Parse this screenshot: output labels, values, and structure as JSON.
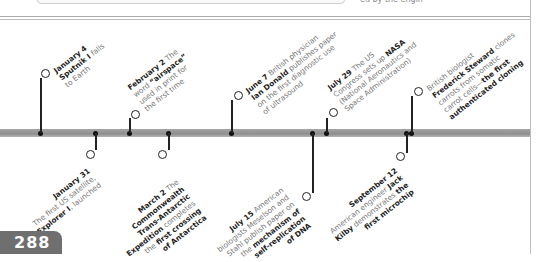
{
  "page": {
    "number": "288"
  },
  "header": {
    "fragment": "ed by the engin"
  },
  "timeline": {
    "above": [
      {
        "date": "January 4",
        "lines": [
          [
            "Sputnik I",
            " falls"
          ],
          [
            "to Earth"
          ]
        ]
      },
      {
        "date": "February 2",
        "lines": [
          [
            " The"
          ],
          [
            "word ",
            "“airspace”"
          ],
          [
            "used in print for"
          ],
          [
            "the first time"
          ]
        ]
      },
      {
        "date": "June 7",
        "lines": [
          [
            " British physician"
          ],
          [
            "Ian Donald",
            " publishes  paper"
          ],
          [
            "on the first diagnostic use"
          ],
          [
            "of ultrasound"
          ]
        ]
      },
      {
        "date": "July 29",
        "lines": [
          [
            " The US"
          ],
          [
            "Congress sets up ",
            "NASA"
          ],
          [
            "(National Aeronautics and"
          ],
          [
            "Space Administration)"
          ]
        ]
      },
      {
        "date": "",
        "lines": [
          [
            "British biologist"
          ],
          [
            "Frederick Steward",
            " clones"
          ],
          [
            "carrots from somatic"
          ],
          [
            "carrot cells—",
            "the first"
          ],
          [
            "authenticated cloning"
          ]
        ]
      }
    ],
    "below": [
      {
        "date": "January 31",
        "lines": [
          [
            "The first US satellite,"
          ],
          [
            "Explorer I",
            ", launched"
          ]
        ]
      },
      {
        "date": "March 2",
        "lines": [
          [
            " The"
          ],
          [
            "Commonwealth"
          ],
          [
            "Trans-Antarctic"
          ],
          [
            "Expedition",
            " completes"
          ],
          [
            "the ",
            "first crossing"
          ],
          [
            "of Antarctica"
          ]
        ]
      },
      {
        "date": "July 15",
        "lines": [
          [
            " American"
          ],
          [
            "biologists Meselson and"
          ],
          [
            "Stahl publish paper on"
          ],
          [
            "the ",
            "mechanism of"
          ],
          [
            "self-replication"
          ],
          [
            "of DNA"
          ]
        ]
      },
      {
        "date": "September 12",
        "lines": [
          [
            "American engineer ",
            "Jack"
          ],
          [
            "Kilby",
            " demonstrates ",
            "the"
          ],
          [
            "first microchip"
          ]
        ]
      }
    ],
    "flat": {
      "a0": {
        "date": "January 4",
        "t1b": "Sputnik I",
        "t1": " falls",
        "t2": "to Earth"
      },
      "a1": {
        "date": "February 2",
        "t0": " The",
        "t1": "word ",
        "t1b": "“airspace”",
        "t2": "used in print for",
        "t3": "the first time"
      },
      "a2": {
        "date": "June 7",
        "t0": " British physician",
        "t1b": "Ian Donald",
        "t1": " publishes  paper",
        "t2": "on the first diagnostic use",
        "t3": "of ultrasound"
      },
      "a3": {
        "date": "July 29",
        "t0": " The US",
        "t1": "Congress sets up ",
        "t1b": "NASA",
        "t2": "(National Aeronautics and",
        "t3": "Space Administration)"
      },
      "a4": {
        "t0": "British biologist",
        "t1b": "Frederick Steward",
        "t1": " clones",
        "t2": "carrots from somatic",
        "t3": "carrot cells—",
        "t3b": "the first",
        "t4b": "authenticated cloning"
      },
      "b0": {
        "date": "January 31",
        "t1": "The first US satellite,",
        "t2b": "Explorer I",
        "t2": ", launched"
      },
      "b1": {
        "date": "March 2",
        "t0": " The",
        "t1b": "Commonwealth",
        "t2b": "Trans-Antarctic",
        "t3b": "Expedition",
        "t3": " completes",
        "t4": "the ",
        "t4b": "first crossing",
        "t5b": "of Antarctica"
      },
      "b2": {
        "date": "July 15",
        "t0": " American",
        "t1": "biologists Meselson and",
        "t2": "Stahl publish paper on",
        "t3": "the ",
        "t3b": "mechanism of",
        "t4b": "self-replication",
        "t5b": "of DNA"
      },
      "b3": {
        "date": "September 12",
        "t1": "American engineer ",
        "t1b": "Jack",
        "t2b": "Kilby",
        "t2": " demonstrates ",
        "t2c": "the",
        "t3b": "first microchip"
      }
    }
  }
}
